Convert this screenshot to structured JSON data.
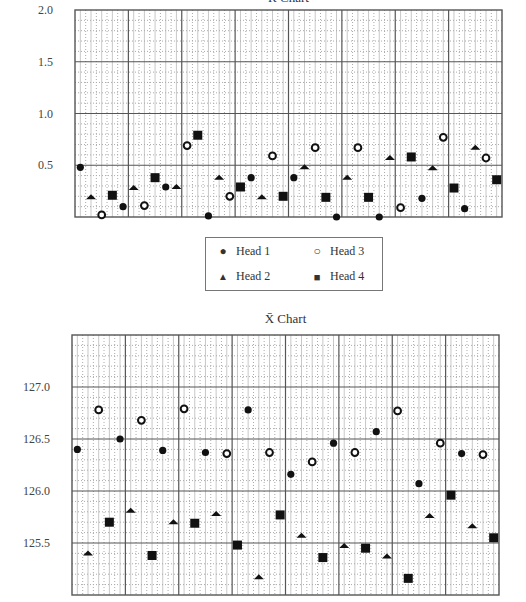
{
  "chart_data": [
    {
      "type": "scatter",
      "title": "R Chart",
      "xlabel": "",
      "ylabel": "",
      "ylim": [
        0.0,
        2.0
      ],
      "yticks": [
        0.5,
        1.0,
        1.5,
        2.0
      ],
      "ytick_labels": [
        "0.5",
        "1.0",
        "1.5",
        "2.0"
      ],
      "grid": true,
      "legend_position": "below",
      "x": [
        1,
        2,
        3,
        4,
        5,
        6,
        7,
        8,
        9,
        10,
        11,
        12,
        13,
        14,
        15,
        16,
        17,
        18,
        19,
        20,
        21,
        22,
        23,
        24,
        25,
        26,
        27,
        28,
        29,
        30,
        31,
        32,
        33,
        34,
        35,
        36,
        37,
        38,
        39,
        40
      ],
      "series": [
        {
          "name": "Head 1",
          "marker": "filled-circle",
          "positions": [
            1,
            5,
            9,
            13,
            17,
            21,
            25,
            29,
            33,
            37
          ],
          "values": [
            0.48,
            0.1,
            0.29,
            0.01,
            0.38,
            0.38,
            0.0,
            0.0,
            0.18,
            0.08
          ]
        },
        {
          "name": "Head 2",
          "marker": "filled-triangle",
          "positions": [
            2,
            6,
            10,
            14,
            18,
            22,
            26,
            30,
            34,
            38
          ],
          "values": [
            0.19,
            0.28,
            0.29,
            0.38,
            0.19,
            0.48,
            0.38,
            0.57,
            0.47,
            0.67
          ]
        },
        {
          "name": "Head 3",
          "marker": "open-circle",
          "positions": [
            3,
            7,
            11,
            15,
            19,
            23,
            27,
            31,
            35,
            39
          ],
          "values": [
            0.02,
            0.11,
            0.69,
            0.2,
            0.59,
            0.67,
            0.67,
            0.09,
            0.77,
            0.57
          ]
        },
        {
          "name": "Head 4",
          "marker": "filled-square",
          "positions": [
            4,
            8,
            12,
            16,
            20,
            24,
            28,
            32,
            36,
            40
          ],
          "values": [
            0.21,
            0.38,
            0.79,
            0.29,
            0.2,
            0.19,
            0.19,
            0.58,
            0.28,
            0.36
          ]
        }
      ]
    },
    {
      "type": "scatter",
      "title": "X̄ Chart",
      "xlabel": "",
      "ylabel": "",
      "ylim": [
        125.0,
        127.5
      ],
      "yticks": [
        125.5,
        126.0,
        126.5,
        127.0
      ],
      "ytick_labels": [
        "125.5",
        "126.0",
        "126.5",
        "127.0"
      ],
      "grid": true,
      "x": [
        1,
        2,
        3,
        4,
        5,
        6,
        7,
        8,
        9,
        10,
        11,
        12,
        13,
        14,
        15,
        16,
        17,
        18,
        19,
        20,
        21,
        22,
        23,
        24,
        25,
        26,
        27,
        28,
        29,
        30,
        31,
        32,
        33,
        34,
        35,
        36,
        37,
        38,
        39,
        40
      ],
      "series": [
        {
          "name": "Head 1",
          "marker": "filled-circle",
          "positions": [
            1,
            5,
            9,
            13,
            17,
            21,
            25,
            29,
            33,
            37
          ],
          "values": [
            126.4,
            126.5,
            126.39,
            126.37,
            126.78,
            126.16,
            126.46,
            126.57,
            126.07,
            126.36
          ]
        },
        {
          "name": "Head 2",
          "marker": "filled-triangle",
          "positions": [
            2,
            6,
            10,
            14,
            18,
            22,
            26,
            30,
            34,
            38
          ],
          "values": [
            125.4,
            125.81,
            125.7,
            125.78,
            125.17,
            125.57,
            125.47,
            125.37,
            125.76,
            125.66
          ]
        },
        {
          "name": "Head 3",
          "marker": "open-circle",
          "positions": [
            3,
            7,
            11,
            15,
            19,
            23,
            27,
            31,
            35,
            39
          ],
          "values": [
            126.78,
            126.68,
            126.79,
            126.36,
            126.37,
            126.28,
            126.37,
            126.77,
            126.46,
            126.35
          ]
        },
        {
          "name": "Head 4",
          "marker": "filled-square",
          "positions": [
            4,
            8,
            12,
            16,
            20,
            24,
            28,
            32,
            36,
            40
          ],
          "values": [
            125.7,
            125.38,
            125.69,
            125.48,
            125.77,
            125.36,
            125.45,
            125.16,
            125.96,
            125.55
          ]
        }
      ]
    }
  ],
  "legend": {
    "items": [
      {
        "label": "Head 1",
        "marker": "filled-circle"
      },
      {
        "label": "Head 3",
        "marker": "open-circle"
      },
      {
        "label": "Head 2",
        "marker": "filled-triangle"
      },
      {
        "label": "Head 4",
        "marker": "filled-square"
      }
    ]
  },
  "colors": {
    "major_grid": "#555555",
    "minor_grid": "#aaaaaa",
    "marker": "#111111"
  }
}
